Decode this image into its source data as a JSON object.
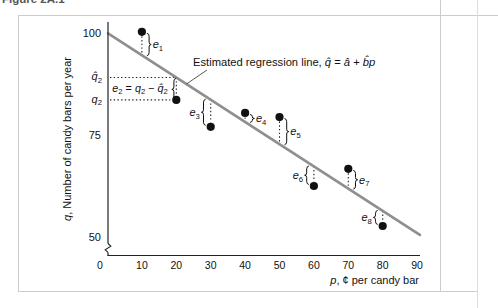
{
  "page": {
    "caption_clipped": "Figure 2A.1",
    "background": "#ffffff",
    "figure_border_color": "#cccccc",
    "page_rule_color": "#dddddd"
  },
  "chart_data": {
    "type": "scatter",
    "title_annotation": "Estimated regression line, q̂ = â + b̂p",
    "annotation_segments": [
      {
        "t": "Estimated regression line, "
      },
      {
        "t": "q̂",
        "italic": true
      },
      {
        "t": " = "
      },
      {
        "t": "â",
        "italic": true
      },
      {
        "t": " + "
      },
      {
        "t": "b̂p",
        "italic": true
      }
    ],
    "xlabel": "p, ¢ per candy bar",
    "xlabel_segments": [
      {
        "t": "p",
        "italic": true
      },
      {
        "t": ", ¢ per candy bar"
      }
    ],
    "ylabel": "q, Number of candy bars per year",
    "ylabel_segments": [
      {
        "t": "q",
        "italic": true
      },
      {
        "t": ", Number of candy bars per year"
      }
    ],
    "x_ticks": [
      0,
      10,
      20,
      30,
      40,
      50,
      60,
      70,
      80,
      90
    ],
    "y_ticks": [
      100,
      75,
      50
    ],
    "x_range": [
      0,
      90
    ],
    "y_range": [
      50,
      100
    ],
    "axis_break_on_y": true,
    "grid": false,
    "regression_line": {
      "intercept": 100,
      "slope": -0.545,
      "color": "#8f8f8f"
    },
    "point_color": "#111111",
    "points": [
      {
        "label": "e",
        "sub": "1",
        "p": 10,
        "q": 100.3,
        "label_side": "right"
      },
      {
        "label": "e",
        "sub": "2",
        "p": 20,
        "q": 83.6,
        "label_side": "special"
      },
      {
        "label": "e",
        "sub": "3",
        "p": 30,
        "q": 77.0,
        "label_side": "left"
      },
      {
        "label": "e",
        "sub": "4",
        "p": 40,
        "q": 80.4,
        "label_side": "right"
      },
      {
        "label": "e",
        "sub": "5",
        "p": 50,
        "q": 79.4,
        "label_side": "right"
      },
      {
        "label": "e",
        "sub": "6",
        "p": 60,
        "q": 62.5,
        "label_side": "left"
      },
      {
        "label": "e",
        "sub": "7",
        "p": 70,
        "q": 66.7,
        "label_side": "right"
      },
      {
        "label": "e",
        "sub": "8",
        "p": 80,
        "q": 52.7,
        "label_side": "left"
      }
    ],
    "e2_callout": {
      "qhat2_value": 89.1,
      "q2_value": 83.6,
      "qhat_axis_label_segments": [
        {
          "t": "q̂",
          "italic": true
        },
        {
          "t": "2",
          "sub": true
        }
      ],
      "q_axis_label_segments": [
        {
          "t": "q",
          "italic": true
        },
        {
          "t": "2",
          "sub": true
        }
      ],
      "expression": "e2 = q2 − q̂2",
      "expression_segments": [
        {
          "t": "e",
          "italic": true
        },
        {
          "t": "2",
          "sub": true
        },
        {
          "t": " = "
        },
        {
          "t": "q",
          "italic": true
        },
        {
          "t": "2",
          "sub": true
        },
        {
          "t": " − "
        },
        {
          "t": "q̂",
          "italic": true
        },
        {
          "t": "2",
          "sub": true
        }
      ]
    }
  }
}
